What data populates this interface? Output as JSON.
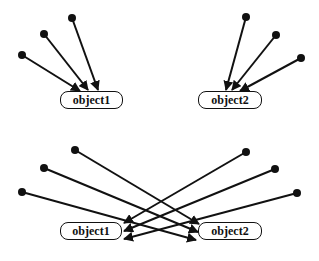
{
  "diagrams": [
    {
      "name": "separate-fan-in",
      "nodes": [
        {
          "id": "object1",
          "label": "object1",
          "x": 60,
          "y": 91,
          "w": 63
        },
        {
          "id": "object2",
          "label": "object2",
          "x": 198,
          "y": 91,
          "w": 64
        }
      ],
      "edges": [
        {
          "from": [
            22,
            55
          ],
          "to": [
            80,
            91
          ]
        },
        {
          "from": [
            44,
            34
          ],
          "to": [
            88,
            90
          ]
        },
        {
          "from": [
            72,
            18
          ],
          "to": [
            98,
            90
          ]
        },
        {
          "from": [
            246,
            17
          ],
          "to": [
            226,
            90
          ]
        },
        {
          "from": [
            276,
            35
          ],
          "to": [
            232,
            90
          ]
        },
        {
          "from": [
            301,
            58
          ],
          "to": [
            240,
            91
          ]
        }
      ]
    },
    {
      "name": "crossed-fan-in",
      "nodes": [
        {
          "id": "object1",
          "label": "object1",
          "x": 60,
          "y": 222,
          "w": 62
        },
        {
          "id": "object2",
          "label": "object2",
          "x": 198,
          "y": 222,
          "w": 64
        }
      ],
      "edges": [
        {
          "from": [
            75,
            150
          ],
          "to": [
            199,
            224
          ]
        },
        {
          "from": [
            44,
            168
          ],
          "to": [
            198,
            232
          ]
        },
        {
          "from": [
            22,
            192
          ],
          "to": [
            196,
            240
          ]
        },
        {
          "from": [
            246,
            152
          ],
          "to": [
            124,
            223
          ]
        },
        {
          "from": [
            275,
            169
          ],
          "to": [
            124,
            231
          ]
        },
        {
          "from": [
            297,
            193
          ],
          "to": [
            124,
            239
          ]
        }
      ]
    }
  ]
}
